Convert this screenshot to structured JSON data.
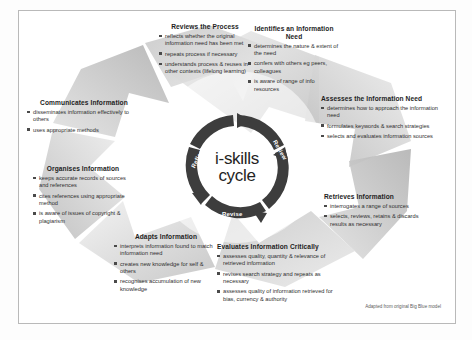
{
  "poster": {
    "centre": {
      "title_line1": "i-skills",
      "title_line2": "cycle",
      "ring_words": [
        "Reflect",
        "Review",
        "Revise"
      ]
    },
    "credit": "Adapted from original Big Blue model",
    "colors": {
      "hub_ring": "#3d3d3d",
      "petal_light": "#e9e9e9",
      "petal_mid": "#d2d2d2",
      "petal_dark": "#b6b6b6",
      "frame_border": "#b9b9b9",
      "heading_text": "#1d1d1d",
      "body_text": "#2f2f2f",
      "bullet": "#4a4a4a"
    },
    "stages": [
      {
        "id": "identifies",
        "heading": "Identifies an Information Need",
        "bullets": [
          "determines the nature & extent of the need",
          "confers with others eg peers, colleagues",
          "is aware of range of info resources"
        ]
      },
      {
        "id": "assesses",
        "heading": "Assesses the Information Need",
        "bullets": [
          "determines how to approach the information need",
          "formulates keywords & search strategies",
          "selects and evaluates information sources"
        ]
      },
      {
        "id": "retrieves",
        "heading": "Retrieves Information",
        "bullets": [
          "interrogates a range of sources",
          "selects, reviews, retains & discards results as necessary"
        ]
      },
      {
        "id": "evaluates",
        "heading": "Evaluates Information Critically",
        "bullets": [
          "assesses quality, quantity & relevance of retrieved information",
          "revises search strategy and repeats as necessary",
          "assesses quality of information retrieved for bias, currency & authority"
        ]
      },
      {
        "id": "adapts",
        "heading": "Adapts Information",
        "bullets": [
          "interprets information found to match information need",
          "creates new knowledge for self & others",
          "recognises accumulation of new knowledge"
        ]
      },
      {
        "id": "organises",
        "heading": "Organises Information",
        "bullets": [
          "keeps accurate records of sources and references",
          "cites references using appropriate method",
          "is aware of issues of copyright & plagiarism"
        ]
      },
      {
        "id": "communicates",
        "heading": "Communicates Information",
        "bullets": [
          "disseminates information effectively to others",
          "uses appropriate methods"
        ]
      },
      {
        "id": "reviews",
        "heading": "Reviews the Process",
        "bullets": [
          "reflects whether the original information need has been met",
          "repeats process if necessary",
          "understands process & reuses in other contexts  (lifelong learning)"
        ]
      }
    ]
  }
}
